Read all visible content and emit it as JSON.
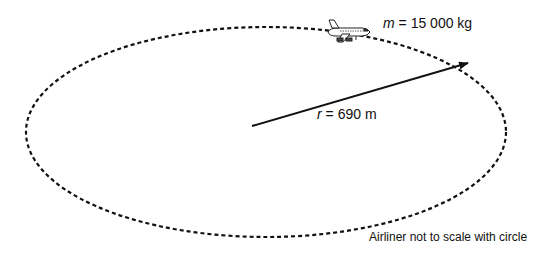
{
  "diagram": {
    "type": "circular-motion",
    "path": {
      "shape": "ellipse",
      "style": "dashed",
      "cx": 266,
      "cy": 132,
      "rx": 240,
      "ry": 105
    },
    "radius_vector": {
      "from": [
        252,
        126
      ],
      "to": [
        468,
        63
      ]
    },
    "mass": {
      "symbol": "m",
      "equals": " = ",
      "value": "15 000",
      "unit": " kg"
    },
    "radius": {
      "symbol": "r",
      "equals": " = ",
      "value": "690",
      "unit": " m"
    },
    "note": "Airliner not to scale with circle",
    "icons": {
      "airliner": "airplane-icon"
    },
    "colors": {
      "stroke": "#111111",
      "background": "#ffffff"
    }
  }
}
